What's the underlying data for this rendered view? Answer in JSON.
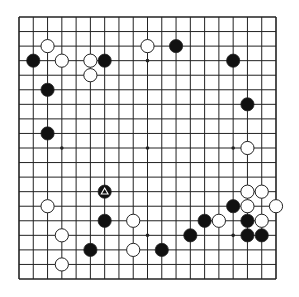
{
  "board": {
    "size": 19,
    "colors": {
      "background": "#ffffff",
      "line": "#222222",
      "black_stone": "#111111",
      "white_stone": "#ffffff",
      "stone_outline": "#222222",
      "marker": "#ffffff"
    },
    "hoshi": [
      [
        4,
        4
      ],
      [
        10,
        4
      ],
      [
        16,
        4
      ],
      [
        4,
        10
      ],
      [
        10,
        10
      ],
      [
        16,
        10
      ],
      [
        4,
        16
      ],
      [
        10,
        16
      ],
      [
        16,
        16
      ]
    ],
    "stones": [
      {
        "color": "black",
        "col": 2,
        "row": 4
      },
      {
        "color": "black",
        "col": 7,
        "row": 4
      },
      {
        "color": "black",
        "col": 12,
        "row": 3
      },
      {
        "color": "black",
        "col": 16,
        "row": 4
      },
      {
        "color": "black",
        "col": 3,
        "row": 6
      },
      {
        "color": "black",
        "col": 17,
        "row": 7
      },
      {
        "color": "black",
        "col": 3,
        "row": 9
      },
      {
        "color": "black",
        "col": 7,
        "row": 13,
        "marker": "triangle"
      },
      {
        "color": "black",
        "col": 7,
        "row": 15
      },
      {
        "color": "black",
        "col": 6,
        "row": 17
      },
      {
        "color": "black",
        "col": 11,
        "row": 17
      },
      {
        "color": "black",
        "col": 14,
        "row": 15
      },
      {
        "color": "black",
        "col": 13,
        "row": 16
      },
      {
        "color": "black",
        "col": 16,
        "row": 14
      },
      {
        "color": "black",
        "col": 17,
        "row": 15
      },
      {
        "color": "black",
        "col": 17,
        "row": 16
      },
      {
        "color": "black",
        "col": 18,
        "row": 16
      },
      {
        "color": "white",
        "col": 3,
        "row": 3
      },
      {
        "color": "white",
        "col": 4,
        "row": 4
      },
      {
        "color": "white",
        "col": 6,
        "row": 4
      },
      {
        "color": "white",
        "col": 6,
        "row": 5
      },
      {
        "color": "white",
        "col": 10,
        "row": 3
      },
      {
        "color": "white",
        "col": 17,
        "row": 10
      },
      {
        "color": "white",
        "col": 3,
        "row": 14
      },
      {
        "color": "white",
        "col": 9,
        "row": 15
      },
      {
        "color": "white",
        "col": 4,
        "row": 16
      },
      {
        "color": "white",
        "col": 9,
        "row": 17
      },
      {
        "color": "white",
        "col": 4,
        "row": 18
      },
      {
        "color": "white",
        "col": 17,
        "row": 13
      },
      {
        "color": "white",
        "col": 18,
        "row": 13
      },
      {
        "color": "white",
        "col": 17,
        "row": 14
      },
      {
        "color": "white",
        "col": 19,
        "row": 14
      },
      {
        "color": "white",
        "col": 15,
        "row": 15
      },
      {
        "color": "white",
        "col": 18,
        "row": 15
      }
    ]
  }
}
